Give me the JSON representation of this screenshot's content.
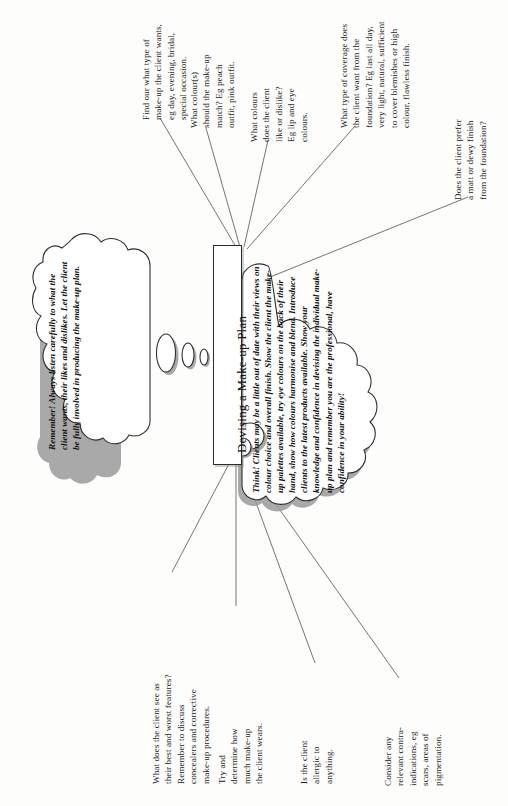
{
  "page": {
    "width": 508,
    "height": 806,
    "background": "#fdfdfc",
    "orientation": "rotated-90-ccw"
  },
  "center": {
    "title": "Devising a Make-up Plan"
  },
  "clouds": [
    {
      "id": "remember-cloud",
      "side": "left",
      "text": "Remember! Always listen carefully to what the client wants, their likes and dislikes. Let the client be fully involved in producing the make-up plan."
    },
    {
      "id": "think-cloud",
      "side": "right",
      "text": "Think! Clients may be a little out of date with their views on colour choice and overall finish. Show the client the make-up palettes available, try eye colours on the back of their hand, show how colours harmonise and blend. Introduce clients to the latest products available. Show your knowledge and confidence in devising the individual make-up plan and remember you are the professional, have confidence in your ability!"
    }
  ],
  "callouts": [
    {
      "id": "callout-type",
      "text": "Find our what type of make-up the client wants, eg day, evening, bridal, special occasion."
    },
    {
      "id": "callout-colour-match",
      "text": "What colour(s) should the make-up match? Eg peach outfit, pink outfit."
    },
    {
      "id": "callout-colour-likes",
      "text": "What colours does the client like or dislike? Eg lip and eye colours."
    },
    {
      "id": "callout-coverage",
      "text": "What type of coverage does the client want from the foundation? Eg last all day, very light, natural, sufficient to cover blemishes or high colour, flawless finish."
    },
    {
      "id": "callout-finish",
      "text": "Does the client prefer a matt or dewy finish from the foundation?"
    },
    {
      "id": "callout-features",
      "text": "What does the client see as their best and worst features? Remember to discuss concealers and corrective make-up procedures."
    },
    {
      "id": "callout-amount",
      "text": "Try and determine how much make-up the client wears."
    },
    {
      "id": "callout-allergy",
      "text": "Is the client allergic to anything."
    },
    {
      "id": "callout-contra",
      "text": "Consider any relevant contra-indications, eg scars, areas of pigmentation."
    }
  ],
  "colors": {
    "ink": "#222222",
    "line": "#3a3a3a",
    "shadow": "#9a9a9a",
    "paper": "#fdfdfc"
  }
}
